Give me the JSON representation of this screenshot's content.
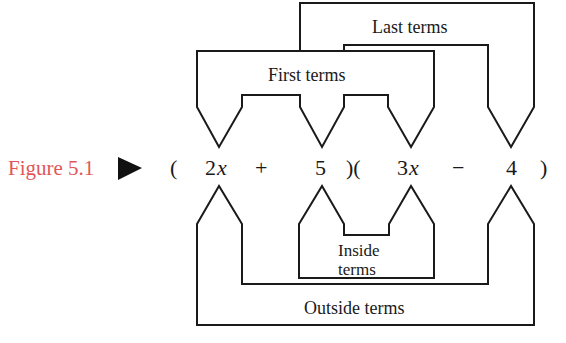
{
  "figure": {
    "label": "Figure 5.1",
    "label_color": "#E0565A",
    "marker_icon": "right-triangle-pointer"
  },
  "expression": {
    "open_paren_1": "(",
    "term_1": "2",
    "term_1_var": "x",
    "operator_1": "+",
    "term_2": "5",
    "close_open_paren": ")(",
    "term_3": "3",
    "term_3_var": "x",
    "operator_2": "−",
    "term_4": "4",
    "close_paren_2": ")"
  },
  "brackets": {
    "first": {
      "label": "First terms",
      "connects": [
        "2x",
        "3x"
      ]
    },
    "last": {
      "label": "Last terms",
      "connects": [
        "5",
        "4"
      ]
    },
    "inside": {
      "label_line1": "Inside",
      "label_line2": "terms",
      "connects": [
        "5",
        "3x"
      ]
    },
    "outside": {
      "label": "Outside terms",
      "connects": [
        "2x",
        "4"
      ]
    }
  },
  "colors": {
    "line": "#1a1a1a",
    "background": "#ffffff",
    "accent": "#E0565A"
  }
}
